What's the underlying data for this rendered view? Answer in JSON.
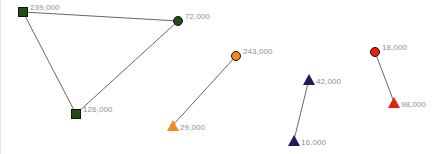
{
  "canvas": {
    "width": 442,
    "height": 154,
    "background": "#ffffff",
    "label_color": "#8f8f8f",
    "edge_color": "#555555"
  },
  "chart_data": {
    "type": "scatter",
    "title": "",
    "xlabel": "",
    "ylabel": "",
    "groups": [
      {
        "name": "green-cluster",
        "color": "#1f4d12",
        "nodes": [
          {
            "id": "g1",
            "label": "239,000",
            "value": 239000,
            "shape": "square",
            "x": 22,
            "y": 12,
            "label_side": "right"
          },
          {
            "id": "g2",
            "label": "72,000",
            "value": 72000,
            "shape": "circle",
            "x": 177,
            "y": 21,
            "label_side": "right"
          },
          {
            "id": "g3",
            "label": "126,000",
            "value": 126000,
            "shape": "square",
            "x": 75,
            "y": 114,
            "label_side": "right"
          }
        ],
        "edges": [
          {
            "from": "g1",
            "to": "g2"
          },
          {
            "from": "g1",
            "to": "g3"
          },
          {
            "from": "g3",
            "to": "g2"
          }
        ]
      },
      {
        "name": "orange-cluster",
        "color": "#ef8b22",
        "nodes": [
          {
            "id": "o1",
            "label": "243,000",
            "value": 243000,
            "shape": "circle",
            "x": 235,
            "y": 56,
            "label_side": "right"
          },
          {
            "id": "o2",
            "label": "29,000",
            "value": 29000,
            "shape": "triangle",
            "x": 172,
            "y": 125,
            "label_side": "right"
          }
        ],
        "edges": [
          {
            "from": "o1",
            "to": "o2"
          }
        ]
      },
      {
        "name": "navy-cluster",
        "color": "#1b1b5e",
        "nodes": [
          {
            "id": "n1",
            "label": "42,000",
            "value": 42000,
            "shape": "triangle",
            "x": 308,
            "y": 79,
            "label_side": "right"
          },
          {
            "id": "n2",
            "label": "16,000",
            "value": 16000,
            "shape": "triangle",
            "x": 293,
            "y": 140,
            "label_side": "right"
          }
        ],
        "edges": [
          {
            "from": "n1",
            "to": "n2"
          }
        ]
      },
      {
        "name": "red-cluster",
        "color": "#e8200f",
        "nodes": [
          {
            "id": "r1",
            "label": "18,000",
            "value": 18000,
            "shape": "circle",
            "x": 374,
            "y": 52,
            "label_side": "right"
          },
          {
            "id": "r2",
            "label": "98,000",
            "value": 98000,
            "shape": "triangle",
            "x": 393,
            "y": 102,
            "label_side": "right"
          }
        ],
        "edges": [
          {
            "from": "r1",
            "to": "r2"
          }
        ]
      }
    ]
  }
}
